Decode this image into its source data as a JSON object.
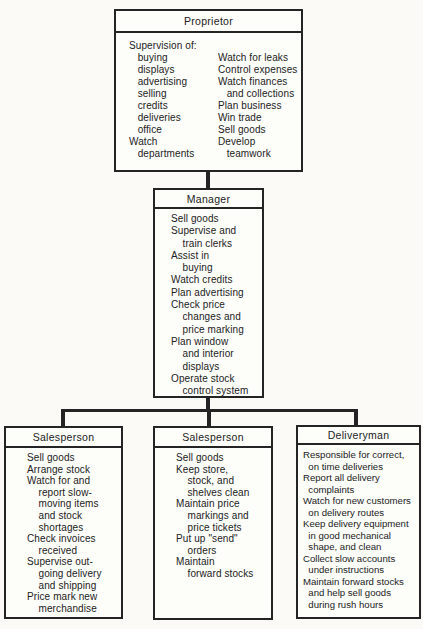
{
  "colors": {
    "background": "#fbfaf6",
    "box_background": "#fdfdfa",
    "line": "#242424",
    "text": "#222222"
  },
  "nodes": {
    "proprietor": {
      "title": "Proprietor",
      "intro": "Supervision of:",
      "left_column": [
        "   buying",
        "   displays",
        "   advertising",
        "   selling",
        "   credits",
        "   deliveries",
        "   office",
        "Watch",
        "   departments"
      ],
      "right_column": [
        "Watch for leaks",
        "Control expenses",
        "Watch finances",
        "   and collections",
        "Plan business",
        "Win trade",
        "Sell goods",
        "Develop",
        "   teamwork"
      ]
    },
    "manager": {
      "title": "Manager",
      "duties": [
        "Sell goods",
        "Supervise and",
        "    train clerks",
        "Assist in",
        "    buying",
        "Watch credits",
        "Plan advertising",
        "Check price",
        "    changes and",
        "    price marking",
        "Plan window",
        "    and interior",
        "    displays",
        "Operate stock",
        "    control system"
      ]
    },
    "salesperson_left": {
      "title": "Salesperson",
      "duties": [
        "Sell goods",
        "Arrange stock",
        "Watch for and",
        "    report slow-",
        "    moving items",
        "    and stock",
        "    shortages",
        "Check invoices",
        "    received",
        "Supervise out-",
        "    going delivery",
        "    and shipping",
        "Price mark new",
        "    merchandise"
      ]
    },
    "salesperson_middle": {
      "title": "Salesperson",
      "duties": [
        "Sell goods",
        "Keep store,",
        "    stock, and",
        "    shelves clean",
        "Maintain price",
        "    markings and",
        "    price tickets",
        "Put up \"send\"",
        "    orders",
        "Maintain",
        "    forward stocks"
      ]
    },
    "deliveryman": {
      "title": "Deliveryman",
      "duties": [
        "Responsible for correct,",
        "  on time deliveries",
        "Report all delivery",
        "  complaints",
        "Watch for new customers",
        "  on delivery routes",
        "Keep delivery equipment",
        "  in good mechanical",
        "  shape, and clean",
        "Collect slow accounts",
        "  under instructions",
        "Maintain forward stocks",
        "  and help sell goods",
        "  during rush hours"
      ]
    }
  }
}
